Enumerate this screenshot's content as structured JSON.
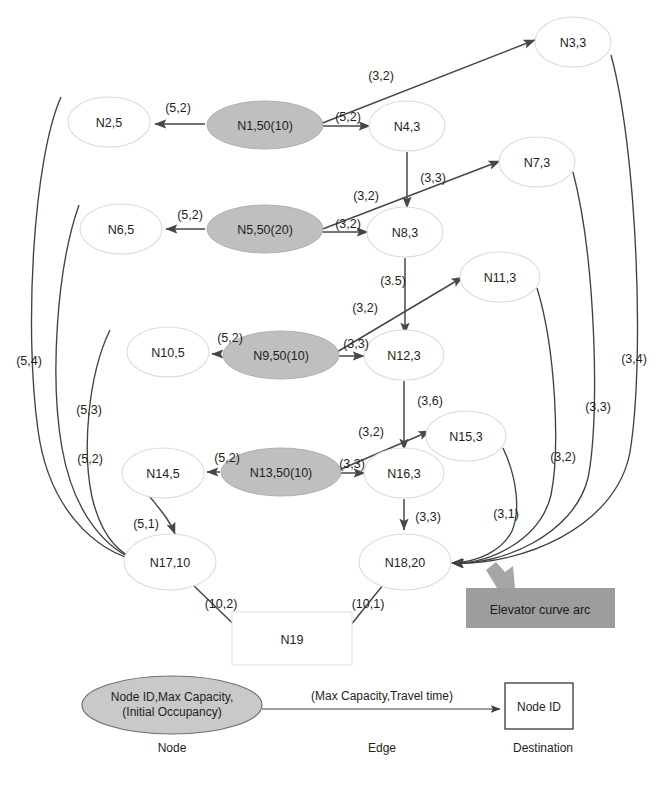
{
  "diagram": {
    "title_visible": false,
    "nodes": [
      {
        "id": "n1",
        "label": "N1,50(10)",
        "type": "source-ellipse",
        "cx": 265,
        "cy": 125,
        "rx": 58,
        "ry": 24
      },
      {
        "id": "n2",
        "label": "N2,5",
        "type": "plain-ellipse",
        "cx": 109,
        "cy": 122,
        "rx": 41,
        "ry": 25
      },
      {
        "id": "n3",
        "label": "N3,3",
        "type": "plain-ellipse",
        "cx": 573,
        "cy": 42,
        "rx": 38,
        "ry": 25
      },
      {
        "id": "n4",
        "label": "N4,3",
        "type": "plain-ellipse",
        "cx": 407,
        "cy": 126,
        "rx": 38,
        "ry": 25
      },
      {
        "id": "n5",
        "label": "N5,50(20)",
        "type": "source-ellipse",
        "cx": 265,
        "cy": 229,
        "rx": 58,
        "ry": 24
      },
      {
        "id": "n6",
        "label": "N6,5",
        "type": "plain-ellipse",
        "cx": 121,
        "cy": 229,
        "rx": 41,
        "ry": 25
      },
      {
        "id": "n7",
        "label": "N7,3",
        "type": "plain-ellipse",
        "cx": 537,
        "cy": 162,
        "rx": 38,
        "ry": 25
      },
      {
        "id": "n8",
        "label": "N8,3",
        "type": "plain-ellipse",
        "cx": 405,
        "cy": 232,
        "rx": 38,
        "ry": 25
      },
      {
        "id": "n9",
        "label": "N9,50(10)",
        "type": "source-ellipse",
        "cx": 281,
        "cy": 355,
        "rx": 58,
        "ry": 24
      },
      {
        "id": "n10",
        "label": "N10,5",
        "type": "plain-ellipse",
        "cx": 168,
        "cy": 352,
        "rx": 41,
        "ry": 25
      },
      {
        "id": "n11",
        "label": "N11,3",
        "type": "plain-ellipse",
        "cx": 500,
        "cy": 277,
        "rx": 40,
        "ry": 25
      },
      {
        "id": "n12",
        "label": "N12,3",
        "type": "plain-ellipse",
        "cx": 404,
        "cy": 355,
        "rx": 40,
        "ry": 25
      },
      {
        "id": "n13",
        "label": "N13,50(10)",
        "type": "source-ellipse",
        "cx": 281,
        "cy": 472,
        "rx": 60,
        "ry": 24
      },
      {
        "id": "n14",
        "label": "N14,5",
        "type": "plain-ellipse",
        "cx": 163,
        "cy": 473,
        "rx": 41,
        "ry": 25
      },
      {
        "id": "n15",
        "label": "N15,3",
        "type": "plain-ellipse",
        "cx": 466,
        "cy": 436,
        "rx": 40,
        "ry": 25
      },
      {
        "id": "n16",
        "label": "N16,3",
        "type": "plain-ellipse",
        "cx": 404,
        "cy": 473,
        "rx": 40,
        "ry": 25
      },
      {
        "id": "n17",
        "label": "N17,10",
        "type": "plain-ellipse",
        "cx": 170,
        "cy": 562,
        "rx": 46,
        "ry": 28
      },
      {
        "id": "n18",
        "label": "N18,20",
        "type": "plain-ellipse",
        "cx": 405,
        "cy": 562,
        "rx": 46,
        "ry": 28
      },
      {
        "id": "n19",
        "label": "N19",
        "type": "rect",
        "x": 232,
        "y": 612,
        "w": 120,
        "h": 53
      }
    ],
    "edges": [
      {
        "from": "n1",
        "to": "n2",
        "label": "(5,2)",
        "kind": "straight"
      },
      {
        "from": "n1",
        "to": "n4",
        "label": "(5,2)",
        "kind": "straight"
      },
      {
        "from": "n1",
        "to": "n3",
        "label": "(3,2)",
        "kind": "diagonal"
      },
      {
        "from": "n4",
        "to": "n8",
        "label": "(3,3)",
        "kind": "vertical"
      },
      {
        "from": "n5",
        "to": "n6",
        "label": "(5,2)",
        "kind": "straight"
      },
      {
        "from": "n5",
        "to": "n8",
        "label": "(3,2)",
        "kind": "straight"
      },
      {
        "from": "n5",
        "to": "n7",
        "label": "(3,2)",
        "kind": "diagonal"
      },
      {
        "from": "n8",
        "to": "n12",
        "label": "(3.5)",
        "kind": "vertical"
      },
      {
        "from": "n9",
        "to": "n10",
        "label": "(5,2)",
        "kind": "straight"
      },
      {
        "from": "n9",
        "to": "n12",
        "label": "(3,3)",
        "kind": "straight"
      },
      {
        "from": "n9",
        "to": "n11",
        "label": "(3,2)",
        "kind": "diagonal"
      },
      {
        "from": "n12",
        "to": "n16",
        "label": "(3,6)",
        "kind": "vertical"
      },
      {
        "from": "n13",
        "to": "n14",
        "label": "(5,2)",
        "kind": "straight"
      },
      {
        "from": "n13",
        "to": "n16",
        "label": "(3,3)",
        "kind": "straight"
      },
      {
        "from": "n13",
        "to": "n15",
        "label": "(3,2)",
        "kind": "diagonal"
      },
      {
        "from": "n14",
        "to": "n17",
        "label": "(5,1)",
        "kind": "short-curve"
      },
      {
        "from": "n16",
        "to": "n18",
        "label": "(3,3)",
        "kind": "vertical"
      },
      {
        "from": "n17",
        "to": "n19",
        "label": "(10,2)",
        "kind": "diagonal"
      },
      {
        "from": "n18",
        "to": "n19",
        "label": "(10,1)",
        "kind": "diagonal"
      },
      {
        "from": "n2",
        "to": "n17",
        "label": "(5,4)",
        "kind": "elevator-left"
      },
      {
        "from": "n6",
        "to": "n17",
        "label": "(5,3)",
        "kind": "elevator-left"
      },
      {
        "from": "n10",
        "to": "n17",
        "label": "(5,2)",
        "kind": "elevator-left"
      },
      {
        "from": "n3",
        "to": "n18",
        "label": "(3,4)",
        "kind": "elevator-right"
      },
      {
        "from": "n7",
        "to": "n18",
        "label": "(3,3)",
        "kind": "elevator-right"
      },
      {
        "from": "n11",
        "to": "n18",
        "label": "(3,2)",
        "kind": "elevator-right"
      },
      {
        "from": "n15",
        "to": "n18",
        "label": "(3,1)",
        "kind": "elevator-right"
      }
    ],
    "callout": {
      "text": "Elevator curve arc",
      "box": {
        "x": 466,
        "y": 588,
        "w": 149,
        "h": 40
      },
      "color": "#9d9d9d"
    },
    "legend": {
      "node_line1": "Node ID,Max Capacity,",
      "node_line2": "(Initial Occupancy)",
      "node_caption": "Node",
      "edge_label": "(Max Capacity,Travel time)",
      "edge_caption": "Edge",
      "dest_label": "Node ID",
      "dest_caption": "Destination"
    },
    "colors": {
      "source_node_fill": "#bfbfbf",
      "plain_node_fill": "#ffffff",
      "edge_stroke": "#44484b",
      "callout_fill": "#9d9d9d",
      "legend_node_fill": "#c9c9c9"
    }
  }
}
